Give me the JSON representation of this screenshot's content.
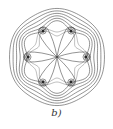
{
  "figure": {
    "caption": "b)",
    "center": [
      57,
      57
    ],
    "outer_contour_radii": [
      48,
      45,
      42,
      39,
      36,
      33
    ],
    "charges": [
      {
        "x": 43,
        "y": 31
      },
      {
        "x": 71,
        "y": 31
      },
      {
        "x": 28,
        "y": 57
      },
      {
        "x": 86,
        "y": 57
      },
      {
        "x": 43,
        "y": 82
      },
      {
        "x": 71,
        "y": 82
      }
    ],
    "colors": {
      "line": "#3a3a3a",
      "background": "#ffffff"
    }
  }
}
